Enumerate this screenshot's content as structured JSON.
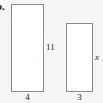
{
  "figure": {
    "part_label": "b.",
    "background_color": "#f7f6f4",
    "stroke_color": "#8a8a8a",
    "fill_color": "#ffffff",
    "text_color": "#1c1c1c"
  },
  "shapes": [
    {
      "name": "large-rectangle",
      "type": "rectangle",
      "width_label": "4",
      "height_label": "11"
    },
    {
      "name": "small-rectangle",
      "type": "rectangle",
      "width_label": "3",
      "height_label": "x"
    }
  ],
  "labels": {
    "large_height": "11",
    "large_width": "4",
    "small_height": "x",
    "small_width": "3"
  }
}
